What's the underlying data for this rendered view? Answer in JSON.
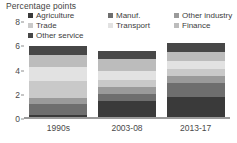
{
  "chart_data": {
    "type": "bar",
    "subtype": "stacked-bar",
    "title": "Percentage points",
    "xlabel": "",
    "ylabel": "Percentage points",
    "ylim": [
      0,
      8
    ],
    "yticks": [
      0,
      2,
      4,
      6,
      8
    ],
    "ytick_labels": [
      "0",
      "2",
      "4",
      "6",
      "8"
    ],
    "grid": false,
    "legend_position": "top",
    "legend_columns": 3,
    "categories": [
      "1990s",
      "2003-08",
      "2013-17"
    ],
    "series": [
      {
        "name": "Agriculture",
        "color": "#3a3a3a",
        "values": [
          0.35,
          1.45,
          1.8
        ]
      },
      {
        "name": "Manuf.",
        "color": "#6e6e6e",
        "values": [
          0.85,
          0.6,
          1.15
        ]
      },
      {
        "name": "Other industry",
        "color": "#9a9a9a",
        "values": [
          0.55,
          0.6,
          0.6
        ]
      },
      {
        "name": "Trade",
        "color": "#c9c9c9",
        "values": [
          1.4,
          0.55,
          0.55
        ]
      },
      {
        "name": "Transport",
        "color": "#e2e2e2",
        "values": [
          1.15,
          0.75,
          0.7
        ]
      },
      {
        "name": "Finance",
        "color": "#bcbcbc",
        "values": [
          1.0,
          1.0,
          0.7
        ]
      },
      {
        "name": "Other service",
        "color": "#474747",
        "values": [
          0.7,
          0.7,
          0.8
        ]
      }
    ],
    "totals": [
      6.0,
      5.65,
      6.3
    ]
  },
  "figure": {
    "title": "Percentage points"
  },
  "legend": {
    "columns": [
      {
        "items": [
          {
            "label": "Agriculture",
            "color": "#3a3a3a"
          },
          {
            "label": "Trade",
            "color": "#c9c9c9"
          },
          {
            "label": "Other service",
            "color": "#474747"
          }
        ]
      },
      {
        "items": [
          {
            "label": "Manuf.",
            "color": "#6e6e6e"
          },
          {
            "label": "Transport",
            "color": "#e2e2e2"
          }
        ]
      },
      {
        "items": [
          {
            "label": "Other industry",
            "color": "#9a9a9a"
          },
          {
            "label": "Finance",
            "color": "#bcbcbc"
          }
        ]
      }
    ]
  },
  "axes": {
    "y_tick_labels": [
      "8",
      "6",
      "4",
      "2",
      "0"
    ],
    "x_tick_labels": [
      "1990s",
      "2003-08",
      "2013-17"
    ]
  }
}
